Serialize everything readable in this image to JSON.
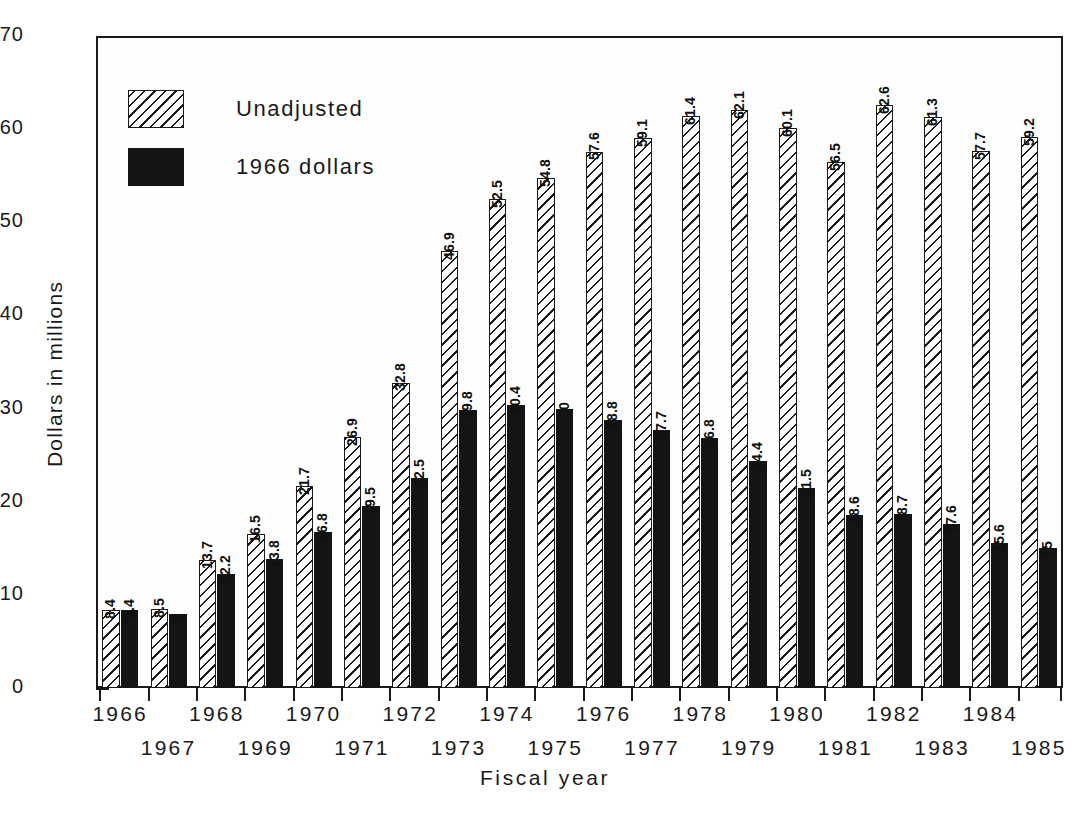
{
  "chart_data": {
    "type": "bar",
    "title": "",
    "xlabel": "Fiscal year",
    "ylabel": "Dollars in millions",
    "ylim": [
      0,
      70
    ],
    "yticks": [
      0,
      10,
      20,
      30,
      40,
      50,
      60,
      70
    ],
    "grid": false,
    "legend_position": "upper-left-inside",
    "categories": [
      "1966",
      "1967",
      "1968",
      "1969",
      "1970",
      "1971",
      "1972",
      "1973",
      "1974",
      "1975",
      "1976",
      "1977",
      "1978",
      "1979",
      "1980",
      "1981",
      "1982",
      "1983",
      "1984",
      "1985"
    ],
    "series": [
      {
        "name": "Unadjusted",
        "style": "hatched",
        "values": [
          8.4,
          8.5,
          13.7,
          16.5,
          21.7,
          26.9,
          32.8,
          46.9,
          52.5,
          54.8,
          57.6,
          59.1,
          61.4,
          62.1,
          60.1,
          56.5,
          62.6,
          61.3,
          57.7,
          59.2
        ],
        "labels": [
          "8.4",
          "8.5",
          "13.7",
          "16.5",
          "21.7",
          "26.9",
          "32.8",
          "46.9",
          "52.5",
          "54.8",
          "57.6",
          "59.1",
          "61.4",
          "62.1",
          "60.1",
          "56.5",
          "62.6",
          "61.3",
          "57.7",
          "59.2"
        ]
      },
      {
        "name": "1966 dollars",
        "style": "solid",
        "values": [
          8.4,
          8,
          12.2,
          13.8,
          16.8,
          19.5,
          22.5,
          29.8,
          30.4,
          30,
          28.8,
          27.7,
          26.8,
          24.4,
          21.5,
          18.6,
          18.7,
          17.6,
          15.6,
          15
        ],
        "labels": [
          "8.4",
          "8",
          "12.2",
          "13.8",
          "16.8",
          "19.5",
          "22.5",
          "29.8",
          "30.4",
          "30",
          "28.8",
          "27.7",
          "26.8",
          "24.4",
          "21.5",
          "18.6",
          "18.7",
          "17.6",
          "15.6",
          "15"
        ]
      }
    ]
  },
  "axes": {
    "y_title": "Dollars in millions",
    "x_title": "Fiscal year",
    "y_tick_labels": [
      "0",
      "10",
      "20",
      "30",
      "40",
      "50",
      "60",
      "70"
    ],
    "x_tick_labels": [
      "1966",
      "1967",
      "1968",
      "1969",
      "1970",
      "1971",
      "1972",
      "1973",
      "1974",
      "1975",
      "1976",
      "1977",
      "1978",
      "1979",
      "1980",
      "1981",
      "1982",
      "1983",
      "1984",
      "1985"
    ]
  },
  "legend": {
    "entries": [
      {
        "label": "Unadjusted",
        "style": "hatched"
      },
      {
        "label": "1966 dollars",
        "style": "solid"
      }
    ]
  },
  "colors": {
    "ink": "#1a1a1a",
    "fill_solid": "#141414",
    "background": "#ffffff"
  }
}
